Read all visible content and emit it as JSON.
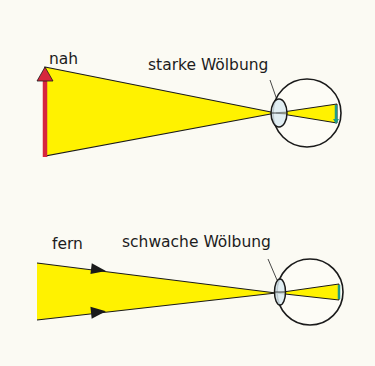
{
  "colors": {
    "background": "#fbfaf3",
    "light_beam": "#fff200",
    "outline": "#1a1a1a",
    "object_arrow": "#d7263d",
    "lens_fill": "#dcebf2",
    "retina_image": "#1f9a8a"
  },
  "panels": [
    {
      "id": "near",
      "object_label": "nah",
      "lens_label": "starke Wölbung",
      "lens_state": "strong curvature",
      "object_type": "red arrow (near object)"
    },
    {
      "id": "far",
      "object_label": "fern",
      "lens_label": "schwache Wölbung",
      "lens_state": "weak curvature",
      "object_type": "parallel rays (distant object)"
    }
  ]
}
